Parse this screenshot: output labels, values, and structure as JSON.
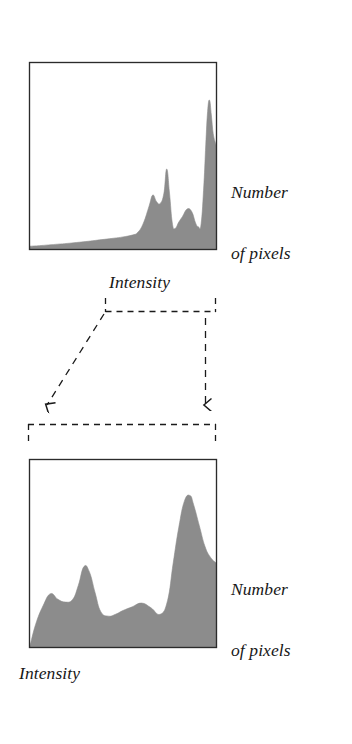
{
  "figure": {
    "kind": "histogram-pair-diagram",
    "background_color": "#ffffff",
    "ink_color": "#1a1a1a",
    "fill_color": "#8c8c8c",
    "labels": {
      "number_of_pixels": "Number\nof pixels",
      "number_of_pixels_line1": "Number",
      "number_of_pixels_line2": "of pixels",
      "intensity": "Intensity"
    }
  },
  "chart_data": [
    {
      "id": "top-histogram",
      "type": "area",
      "title": "",
      "xlabel": "Intensity",
      "ylabel": "Number of pixels",
      "xlim": [
        0,
        1
      ],
      "ylim": [
        0,
        1
      ],
      "grid": false,
      "legend": "none",
      "fill_color": "#8c8c8c",
      "border_color": "#1a1a1a",
      "description": "Histogram concentrated toward high intensities, with a narrow dominant spike near the maximum intensity.",
      "x": [
        0.0,
        0.05,
        0.1,
        0.15,
        0.2,
        0.25,
        0.3,
        0.35,
        0.4,
        0.45,
        0.5,
        0.55,
        0.58,
        0.61,
        0.64,
        0.66,
        0.68,
        0.7,
        0.72,
        0.735,
        0.75,
        0.765,
        0.78,
        0.8,
        0.82,
        0.845,
        0.87,
        0.89,
        0.905,
        0.92,
        0.935,
        0.945,
        0.955,
        0.965,
        0.975,
        0.985,
        1.0
      ],
      "y": [
        0.015,
        0.018,
        0.022,
        0.026,
        0.03,
        0.035,
        0.04,
        0.046,
        0.052,
        0.058,
        0.065,
        0.075,
        0.09,
        0.14,
        0.23,
        0.29,
        0.255,
        0.245,
        0.3,
        0.43,
        0.3,
        0.14,
        0.11,
        0.145,
        0.175,
        0.215,
        0.2,
        0.14,
        0.12,
        0.135,
        0.35,
        0.56,
        0.74,
        0.8,
        0.72,
        0.62,
        0.56
      ]
    },
    {
      "id": "bottom-histogram",
      "type": "area",
      "title": "",
      "xlabel": "Intensity",
      "ylabel": "Number of pixels",
      "xlim": [
        0,
        1
      ],
      "ylim": [
        0,
        1
      ],
      "grid": false,
      "legend": "none",
      "fill_color": "#8c8c8c",
      "border_color": "#1a1a1a",
      "description": "Same histogram after stretching across the full intensity range: low broad bumps at low intensity, a mid plateau, and a tall peak near high intensity.",
      "x": [
        0.0,
        0.03,
        0.07,
        0.11,
        0.15,
        0.19,
        0.23,
        0.26,
        0.29,
        0.32,
        0.35,
        0.38,
        0.42,
        0.46,
        0.5,
        0.55,
        0.6,
        0.65,
        0.7,
        0.74,
        0.77,
        0.8,
        0.83,
        0.86,
        0.88,
        0.91,
        0.94,
        0.97,
        1.0
      ],
      "y": [
        0.005,
        0.12,
        0.22,
        0.285,
        0.255,
        0.24,
        0.255,
        0.33,
        0.43,
        0.4,
        0.29,
        0.19,
        0.165,
        0.175,
        0.195,
        0.215,
        0.235,
        0.21,
        0.175,
        0.25,
        0.45,
        0.64,
        0.78,
        0.81,
        0.76,
        0.65,
        0.54,
        0.48,
        0.45
      ]
    }
  ],
  "annotations": {
    "top_bracket": {
      "name": "intensity-range-source-bracket",
      "style": "dashed",
      "x_start": 105,
      "x_end": 216,
      "y": 312
    },
    "bottom_bracket": {
      "name": "intensity-range-target-bracket",
      "style": "dashed",
      "x_start": 28,
      "x_end": 216,
      "y": 424
    },
    "arrows": [
      {
        "name": "left-mapping-arrow",
        "style": "dashed",
        "from": [
          105,
          312
        ],
        "to": [
          43,
          414
        ]
      },
      {
        "name": "right-mapping-arrow",
        "style": "dashed",
        "from": [
          205,
          312
        ],
        "to": [
          205,
          414
        ]
      }
    ]
  }
}
